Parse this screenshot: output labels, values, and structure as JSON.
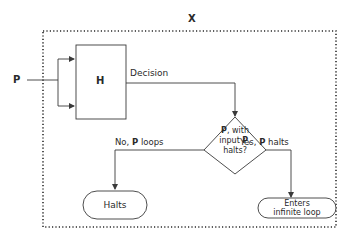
{
  "diagram": {
    "outer_label": "X",
    "input_label": "P",
    "machine_label": "H",
    "decision_edge_label": "Decision",
    "decision_node": {
      "line1_bold": "P",
      "line1_rest": ", with",
      "line2_pre": "input ",
      "line2_bold": "P",
      "line2_post": ",",
      "line3": "halts?"
    },
    "no_edge": {
      "pre": "No, ",
      "bold": "P",
      "post": " loops"
    },
    "yes_edge": {
      "pre": "Yes, ",
      "bold": "P",
      "post": " halts"
    },
    "halts_node": "Halts",
    "loop_node": {
      "line1": "Enters",
      "line2": "infinite loop"
    },
    "colors": {
      "stroke": "#3a3a3a",
      "dotted": "#2a2a2a",
      "text": "#2a2a2a"
    }
  }
}
